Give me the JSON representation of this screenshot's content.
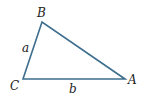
{
  "diagram": {
    "type": "triangle",
    "stroke_color": "#3d6e8e",
    "vertices": [
      {
        "name": "A",
        "label": "A",
        "x": 125,
        "y": 79
      },
      {
        "name": "B",
        "label": "B",
        "x": 42,
        "y": 22
      },
      {
        "name": "C",
        "label": "C",
        "x": 23,
        "y": 79
      }
    ],
    "sides": [
      {
        "name": "a",
        "label": "a",
        "from": "B",
        "to": "C"
      },
      {
        "name": "b",
        "label": "b",
        "from": "C",
        "to": "A"
      }
    ]
  }
}
